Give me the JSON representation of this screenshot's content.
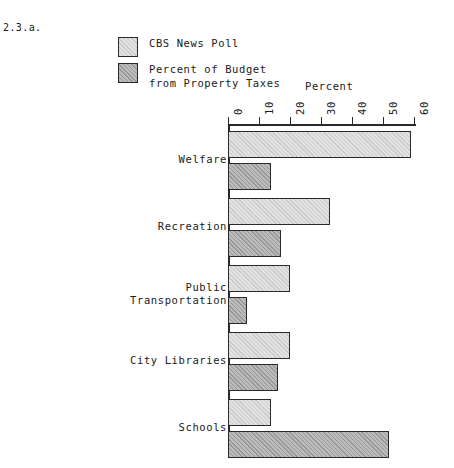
{
  "figure_label": "2.3.a.",
  "legend": {
    "items": [
      {
        "swatch": "light-gray-swatch",
        "label": "CBS News Poll"
      },
      {
        "swatch": "dark-gray-swatch",
        "label": "Percent of Budget\nfrom Property Taxes"
      }
    ]
  },
  "colors": {
    "series_light": "#e2e2e2",
    "series_dark": "#bcbcbc",
    "outline": "#2a2a2a",
    "background": "#ffffff"
  },
  "chart_data": {
    "type": "bar",
    "orientation": "horizontal",
    "title": "",
    "xlabel": "Percent",
    "ylabel": "",
    "xlim": [
      0,
      60
    ],
    "xticks": [
      0,
      10,
      20,
      30,
      40,
      50,
      60
    ],
    "xtick_labels": [
      "0",
      "10",
      "20",
      "30",
      "40",
      "50",
      "60"
    ],
    "grid": false,
    "legend_position": "top-left",
    "categories": [
      "Welfare",
      "Recreation",
      "Public\nTransportation",
      "City Libraries",
      "Schools"
    ],
    "series": [
      {
        "name": "CBS News Poll",
        "values": [
          59,
          33,
          20,
          20,
          14
        ]
      },
      {
        "name": "Percent of Budget from Property Taxes",
        "values": [
          14,
          17,
          6,
          16,
          52
        ]
      }
    ]
  }
}
